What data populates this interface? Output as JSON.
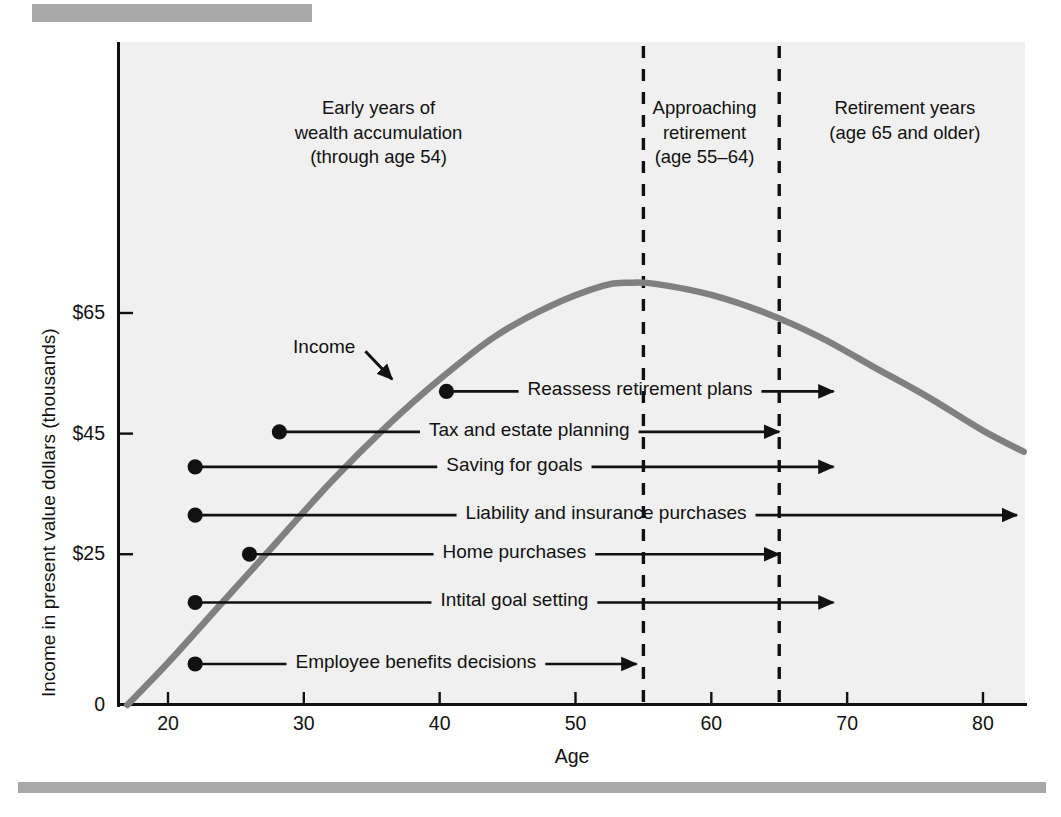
{
  "chart_data": {
    "type": "line",
    "title": "",
    "xlabel": "Age",
    "ylabel": "Income in present value dollars (thousands)",
    "xlim": [
      17,
      83.5
    ],
    "ylim": [
      0,
      73
    ],
    "grid": false,
    "legend_position": "none",
    "xticks": [
      "20",
      "30",
      "40",
      "50",
      "60",
      "70",
      "80"
    ],
    "xtick_values": [
      20,
      30,
      40,
      50,
      60,
      70,
      80
    ],
    "yticks": [
      "0",
      "$25",
      "$45",
      "$65"
    ],
    "ytick_values": [
      0,
      25,
      45,
      65
    ],
    "series": [
      {
        "name": "Income",
        "label": "Income",
        "color": "#808080",
        "x": [
          17,
          20,
          24,
          28,
          32,
          36,
          40,
          44,
          48,
          52,
          54,
          56,
          60,
          64,
          68,
          72,
          76,
          80,
          83
        ],
        "values": [
          0,
          7,
          17,
          27,
          37,
          46,
          54,
          61,
          66,
          69.5,
          70,
          69.8,
          68,
          65,
          61,
          56,
          51,
          45.5,
          42
        ]
      }
    ],
    "annotations": [
      {
        "name": "income-curve-label",
        "text": "Income",
        "type": "arrow-label",
        "label_age": 31.5,
        "label_value": 59,
        "arrow_to_age": 36.5,
        "arrow_to_value": 54
      }
    ],
    "zones": [
      {
        "name": "early-years",
        "label_lines": [
          "Early years of",
          "wealth accumulation",
          "(through age 54)"
        ],
        "age_range": [
          17,
          54
        ]
      },
      {
        "name": "approaching-retirement",
        "label_lines": [
          "Approaching",
          "retirement",
          "(age 55–64)"
        ],
        "age_range": [
          55,
          64
        ]
      },
      {
        "name": "retirement-years",
        "label_lines": [
          "Retirement years",
          "(age 65 and older)"
        ],
        "age_range": [
          65,
          83.5
        ]
      }
    ],
    "zone_dividers": [
      {
        "name": "divider-age-55",
        "age": 55,
        "style": "dashed"
      },
      {
        "name": "divider-age-65",
        "age": 65,
        "style": "dashed"
      }
    ],
    "tasks": [
      {
        "name": "reassess-retirement-plans",
        "label": "Reassess retirement plans",
        "start_age": 40.5,
        "end_age": 69.0,
        "value": 52,
        "dot": true,
        "arrowhead": true
      },
      {
        "name": "tax-and-estate-planning",
        "label": "Tax and estate planning",
        "start_age": 28.2,
        "end_age": 65.0,
        "value": 45.3,
        "dot": true,
        "arrowhead": true
      },
      {
        "name": "saving-for-goals",
        "label": "Saving for goals",
        "start_age": 22.0,
        "end_age": 69.0,
        "value": 39.5,
        "dot": true,
        "arrowhead": true
      },
      {
        "name": "liability-and-insurance-purchases",
        "label": "Liability and insurance purchases",
        "start_age": 22.0,
        "end_age": 82.5,
        "value": 31.5,
        "dot": true,
        "arrowhead": true
      },
      {
        "name": "home-purchases",
        "label": "Home purchases",
        "start_age": 26.0,
        "end_age": 65.0,
        "value": 25.0,
        "dot": true,
        "arrowhead": true
      },
      {
        "name": "intital-goal-setting",
        "label": "Intital goal setting",
        "start_age": 22.0,
        "end_age": 69.0,
        "value": 17.0,
        "dot": true,
        "arrowhead": true
      },
      {
        "name": "employee-benefits-decisions",
        "label": "Employee benefits decisions",
        "start_age": 22.0,
        "end_age": 54.5,
        "value": 6.8,
        "dot": true,
        "arrowhead": true
      }
    ],
    "colors": {
      "curve": "#808080",
      "plot_background": "#f0f0f0",
      "axis": "#111111",
      "task_line": "#111111",
      "rule_bar": "#a9a9a9",
      "text": "#111111"
    }
  }
}
